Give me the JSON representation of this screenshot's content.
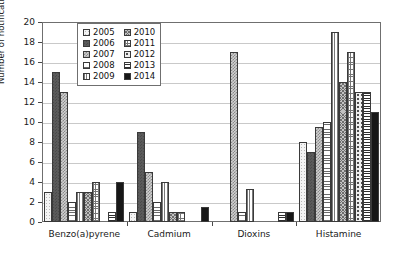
{
  "chart_data": {
    "type": "bar",
    "title": "",
    "subtitle": "",
    "xlabel": "",
    "ylabel": "Number of notifications",
    "ylim": [
      0,
      20
    ],
    "ytick_step": 2,
    "yticks": [
      0,
      2,
      4,
      6,
      8,
      10,
      12,
      14,
      16,
      18,
      20
    ],
    "grid": true,
    "grid_axis": "y",
    "legend_position": "top-left-inside",
    "categories": [
      "Benzo(a)pyrene",
      "Cadmium",
      "Dioxins",
      "Histamine"
    ],
    "series": [
      {
        "name": "2005",
        "values": [
          3,
          1,
          0,
          8
        ]
      },
      {
        "name": "2006",
        "values": [
          15,
          9,
          0,
          7
        ]
      },
      {
        "name": "2007",
        "values": [
          13,
          5,
          17,
          9.5
        ]
      },
      {
        "name": "2008",
        "values": [
          2,
          2,
          1,
          10
        ]
      },
      {
        "name": "2009",
        "values": [
          3,
          4,
          3.3,
          19
        ]
      },
      {
        "name": "2010",
        "values": [
          3,
          1,
          0,
          14
        ]
      },
      {
        "name": "2011",
        "values": [
          4,
          1,
          0,
          17
        ]
      },
      {
        "name": "2012",
        "values": [
          0,
          0,
          0,
          13
        ]
      },
      {
        "name": "2013",
        "values": [
          1,
          0,
          1,
          13
        ]
      },
      {
        "name": "2014",
        "values": [
          4,
          1.5,
          1,
          11
        ]
      }
    ]
  },
  "legend": {
    "entries": [
      {
        "label": "2005",
        "swatch": "p2005"
      },
      {
        "label": "2010",
        "swatch": "p2010"
      },
      {
        "label": "2006",
        "swatch": "p2006"
      },
      {
        "label": "2011",
        "swatch": "p2011"
      },
      {
        "label": "2007",
        "swatch": "p2007"
      },
      {
        "label": "2012",
        "swatch": "p2012"
      },
      {
        "label": "2008",
        "swatch": "p2008"
      },
      {
        "label": "2013",
        "swatch": "p2013"
      },
      {
        "label": "2009",
        "swatch": "p2009"
      },
      {
        "label": "2014",
        "swatch": "p2014"
      }
    ]
  },
  "colors": {
    "axis": "#6f6f6f",
    "grid": "#c9c9c9",
    "text": "#1a1a1a",
    "plot_background": "#ffffff"
  }
}
